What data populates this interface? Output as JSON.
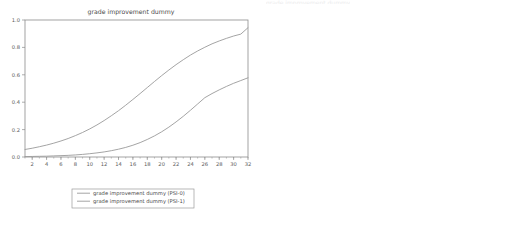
{
  "figure": {
    "width": 525,
    "height": 225,
    "background": "#ffffff",
    "line_color": "#9a9a9a",
    "axis_color": "#8c8c8c",
    "text_color": "#5a5a5a"
  },
  "chart_data": [
    {
      "id": "left-panel",
      "type": "line",
      "title": "grade improvement dummy",
      "xlabel": "",
      "ylabel": "",
      "xlim": [
        1,
        32
      ],
      "ylim": [
        0.0,
        1.0
      ],
      "grid": false,
      "legend_position": "below",
      "xticks": [
        2,
        4,
        6,
        8,
        10,
        12,
        14,
        16,
        18,
        20,
        22,
        24,
        26,
        28,
        30,
        32
      ],
      "xticklabels": [
        "2",
        "4",
        "6",
        "8",
        "10",
        "12",
        "14",
        "16",
        "18",
        "20",
        "22",
        "24",
        "26",
        "28",
        "30",
        "32"
      ],
      "yticks": [
        0.0,
        0.2,
        0.4,
        0.6,
        0.8,
        1.0
      ],
      "yticklabels": [
        "0.0",
        "0.2",
        "0.4",
        "0.6",
        "0.8",
        "1.0"
      ],
      "minor_xtick_step": 1,
      "series": [
        {
          "name": "grade improvement dummy (PSI-0)",
          "x": [
            1,
            2,
            3,
            4,
            5,
            6,
            7,
            8,
            9,
            10,
            11,
            12,
            13,
            14,
            15,
            16,
            17,
            18,
            19,
            20,
            21,
            22,
            23,
            24,
            25,
            26,
            27,
            28,
            29,
            30,
            31,
            32
          ],
          "values": [
            0.055,
            0.064,
            0.075,
            0.087,
            0.101,
            0.117,
            0.135,
            0.156,
            0.179,
            0.205,
            0.234,
            0.266,
            0.301,
            0.338,
            0.378,
            0.42,
            0.463,
            0.507,
            0.551,
            0.594,
            0.635,
            0.674,
            0.71,
            0.744,
            0.774,
            0.801,
            0.826,
            0.847,
            0.866,
            0.883,
            0.897,
            0.944
          ]
        },
        {
          "name": "grade improvement dummy (PSI-1)",
          "x": [
            1,
            2,
            3,
            4,
            5,
            6,
            7,
            8,
            9,
            10,
            11,
            12,
            13,
            14,
            15,
            16,
            17,
            18,
            19,
            20,
            21,
            22,
            23,
            24,
            25,
            26,
            27,
            28,
            29,
            30,
            31,
            32
          ],
          "values": [
            0.003,
            0.004,
            0.005,
            0.006,
            0.008,
            0.01,
            0.012,
            0.015,
            0.019,
            0.024,
            0.03,
            0.037,
            0.046,
            0.057,
            0.07,
            0.086,
            0.105,
            0.128,
            0.154,
            0.184,
            0.218,
            0.256,
            0.297,
            0.341,
            0.387,
            0.433,
            0.463,
            0.49,
            0.515,
            0.538,
            0.558,
            0.578
          ]
        }
      ],
      "legend": [
        {
          "label": "grade improvement dummy (PSI-0)",
          "color": "#9a9a9a"
        },
        {
          "label": "grade improvement dummy (PSI-1)",
          "color": "#9a9a9a"
        }
      ]
    },
    {
      "id": "right-panel",
      "type": "line",
      "title": "",
      "clipped_title": "grade improvement dummy",
      "xlabel": "Student's GPA",
      "ylabel": "Probability of Grade Improvement",
      "xlim": [
        2.0,
        4.0
      ],
      "ylim": [
        0.0,
        1.0
      ],
      "grid": false,
      "legend_position": "inline-annotations",
      "xticks": [
        2.0,
        2.2,
        2.4,
        2.6,
        2.8,
        3.0,
        3.2,
        3.4,
        3.6,
        3.8
      ],
      "xticklabels": [
        "2.0",
        "2.2",
        "2.4",
        "2.6",
        "2.8",
        "3.0",
        "3.2",
        "3.4",
        "3.6",
        "3.8"
      ],
      "yticks": [
        0.0,
        0.2,
        0.4,
        0.6,
        0.8,
        1.0
      ],
      "yticklabels": [
        "0.0",
        "0.2",
        "0.4",
        "0.6",
        "0.8",
        "1.0"
      ],
      "minor_xtick_step": 0.05,
      "series": [
        {
          "name": "With PSI",
          "x": [
            2.0,
            2.1,
            2.2,
            2.3,
            2.4,
            2.5,
            2.6,
            2.7,
            2.8,
            2.9,
            3.0,
            3.1,
            3.2,
            3.3,
            3.4,
            3.5,
            3.6,
            3.7,
            3.8,
            3.9,
            4.0
          ],
          "values": [
            0.055,
            0.074,
            0.098,
            0.129,
            0.168,
            0.216,
            0.273,
            0.339,
            0.411,
            0.487,
            0.562,
            0.633,
            0.697,
            0.753,
            0.8,
            0.839,
            0.87,
            0.895,
            0.915,
            0.931,
            0.944
          ]
        },
        {
          "name": "Without PSI",
          "x": [
            2.0,
            2.1,
            2.2,
            2.3,
            2.4,
            2.5,
            2.6,
            2.7,
            2.8,
            2.9,
            3.0,
            3.1,
            3.2,
            3.3,
            3.4,
            3.5,
            3.6,
            3.7,
            3.8,
            3.9,
            4.0
          ],
          "values": [
            0.003,
            0.005,
            0.008,
            0.012,
            0.018,
            0.027,
            0.04,
            0.058,
            0.084,
            0.118,
            0.162,
            0.216,
            0.28,
            0.348,
            0.416,
            0.45,
            0.478,
            0.505,
            0.53,
            0.554,
            0.578
          ]
        }
      ],
      "annotations": [
        {
          "text": "With PSI",
          "x": 2.95,
          "y": 0.62
        },
        {
          "text": "Without PSI",
          "x": 3.46,
          "y": 0.375
        }
      ]
    }
  ]
}
